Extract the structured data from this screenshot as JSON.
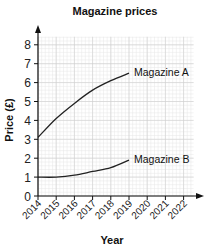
{
  "chart_data": {
    "type": "line",
    "title": "Magazine prices",
    "xlabel": "Year",
    "ylabel": "Price (£)",
    "x": [
      2014,
      2015,
      2016,
      2017,
      2018,
      2019
    ],
    "x_ticks": [
      "2014",
      "2015",
      "2016",
      "2017",
      "2018",
      "2019",
      "2020",
      "2021",
      "2022"
    ],
    "y_ticks": [
      "0",
      "1",
      "2",
      "3",
      "4",
      "5",
      "6",
      "7",
      "8"
    ],
    "xlim": [
      2014,
      2022
    ],
    "ylim": [
      0,
      8
    ],
    "grid": true,
    "legend_position": "inline labels at line ends",
    "series": [
      {
        "name": "Magazine A",
        "values": [
          3.1,
          4.1,
          4.9,
          5.6,
          6.1,
          6.5
        ]
      },
      {
        "name": "Magazine B",
        "values": [
          1.0,
          1.0,
          1.1,
          1.3,
          1.5,
          1.9
        ]
      }
    ]
  },
  "colors": {
    "line": "#222222",
    "grid_minor": "#e6e6e6",
    "grid_major": "#cfcfcf",
    "axis": "#111111"
  }
}
